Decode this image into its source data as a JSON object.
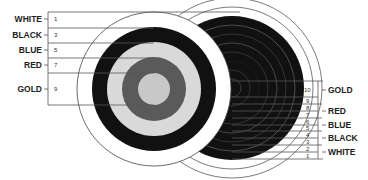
{
  "colors": {
    "white": "#ffffff",
    "black": "#111111",
    "blue": "#d9d9d9",
    "red": "#5a5a5a",
    "gold": "#c8c8c8",
    "line": "#555555"
  },
  "left_target": {
    "description": "Target with 5 scoring zones (odd numbers)",
    "zones": [
      {
        "label": "WHITE",
        "score": "1"
      },
      {
        "label": "BLACK",
        "score": "3"
      },
      {
        "label": "BLUE",
        "score": "5"
      },
      {
        "label": "RED",
        "score": "7"
      },
      {
        "label": "GOLD",
        "score": "9"
      }
    ]
  },
  "right_target": {
    "description": "Target with 10 scoring rings",
    "zones": [
      {
        "label": "GOLD",
        "scores": [
          "10",
          "9"
        ]
      },
      {
        "label": "RED",
        "scores": [
          "8",
          "7"
        ]
      },
      {
        "label": "BLUE",
        "scores": [
          "6",
          "5"
        ]
      },
      {
        "label": "BLACK",
        "scores": [
          "4",
          "3"
        ]
      },
      {
        "label": "WHITE",
        "scores": [
          "2",
          "1"
        ]
      }
    ]
  }
}
